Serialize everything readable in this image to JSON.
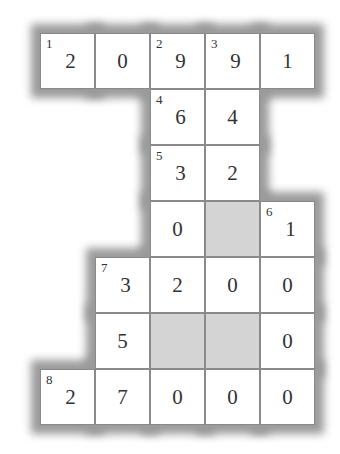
{
  "puzzle": {
    "type": "cross-number",
    "cols": 5,
    "rows": 7,
    "colors": {
      "cell_bg": "#ffffff",
      "shaded_bg": "#d4d4d4",
      "grid_line": "#8a8a8a",
      "text": "#333333",
      "border_shadow": "#9a9a9a"
    },
    "cells": [
      {
        "r": 0,
        "c": 0,
        "clue": "1",
        "value": "2"
      },
      {
        "r": 0,
        "c": 1,
        "clue": "",
        "value": "0"
      },
      {
        "r": 0,
        "c": 2,
        "clue": "2",
        "value": "9"
      },
      {
        "r": 0,
        "c": 3,
        "clue": "3",
        "value": "9"
      },
      {
        "r": 0,
        "c": 4,
        "clue": "",
        "value": "1"
      },
      {
        "r": 1,
        "c": 2,
        "clue": "4",
        "value": "6"
      },
      {
        "r": 1,
        "c": 3,
        "clue": "",
        "value": "4"
      },
      {
        "r": 2,
        "c": 2,
        "clue": "5",
        "value": "3"
      },
      {
        "r": 2,
        "c": 3,
        "clue": "",
        "value": "2"
      },
      {
        "r": 3,
        "c": 2,
        "clue": "",
        "value": "0"
      },
      {
        "r": 3,
        "c": 3,
        "clue": "",
        "value": "",
        "shaded": true
      },
      {
        "r": 3,
        "c": 4,
        "clue": "6",
        "value": "1"
      },
      {
        "r": 4,
        "c": 1,
        "clue": "7",
        "value": "3"
      },
      {
        "r": 4,
        "c": 2,
        "clue": "",
        "value": "2"
      },
      {
        "r": 4,
        "c": 3,
        "clue": "",
        "value": "0"
      },
      {
        "r": 4,
        "c": 4,
        "clue": "",
        "value": "0"
      },
      {
        "r": 5,
        "c": 1,
        "clue": "",
        "value": "5"
      },
      {
        "r": 5,
        "c": 2,
        "clue": "",
        "value": "",
        "shaded": true
      },
      {
        "r": 5,
        "c": 3,
        "clue": "",
        "value": "",
        "shaded": true
      },
      {
        "r": 5,
        "c": 4,
        "clue": "",
        "value": "0"
      },
      {
        "r": 6,
        "c": 0,
        "clue": "8",
        "value": "2"
      },
      {
        "r": 6,
        "c": 1,
        "clue": "",
        "value": "7"
      },
      {
        "r": 6,
        "c": 2,
        "clue": "",
        "value": "0"
      },
      {
        "r": 6,
        "c": 3,
        "clue": "",
        "value": "0"
      },
      {
        "r": 6,
        "c": 4,
        "clue": "",
        "value": "0"
      }
    ]
  }
}
